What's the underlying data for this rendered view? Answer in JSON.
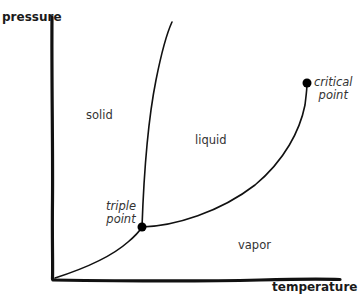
{
  "diagram": {
    "type": "phase-diagram",
    "axes": {
      "y_label": "pressure",
      "x_label": "temperature"
    },
    "regions": {
      "solid": "solid",
      "liquid": "liquid",
      "vapor": "vapor"
    },
    "points": {
      "triple_line1": "triple",
      "triple_line2": "point",
      "critical_line1": "critical",
      "critical_line2": "point"
    },
    "colors": {
      "line": "#111111",
      "text": "#333333",
      "background": "#ffffff"
    }
  }
}
